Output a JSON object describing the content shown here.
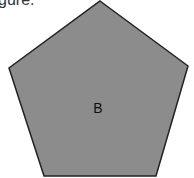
{
  "caption": "gure:",
  "shape": {
    "type": "pentagon",
    "label": "B",
    "fill": "#8c8c8c",
    "stroke": "#222222",
    "points": "100,1 188,66 156,176 44,176 9,68"
  }
}
